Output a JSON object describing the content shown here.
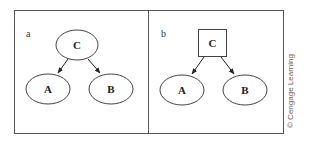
{
  "figure": {
    "panels": [
      {
        "label": "a",
        "root": {
          "label": "C",
          "shape": "ellipse"
        },
        "children": [
          {
            "label": "A",
            "shape": "ellipse"
          },
          {
            "label": "B",
            "shape": "ellipse"
          }
        ],
        "edges": [
          [
            "C",
            "A"
          ],
          [
            "C",
            "B"
          ]
        ]
      },
      {
        "label": "b",
        "root": {
          "label": "C",
          "shape": "square"
        },
        "children": [
          {
            "label": "A",
            "shape": "ellipse"
          },
          {
            "label": "B",
            "shape": "ellipse"
          }
        ],
        "edges": [
          [
            "C",
            "A"
          ],
          [
            "C",
            "B"
          ]
        ]
      }
    ],
    "credit": "© Cengage Learning"
  }
}
